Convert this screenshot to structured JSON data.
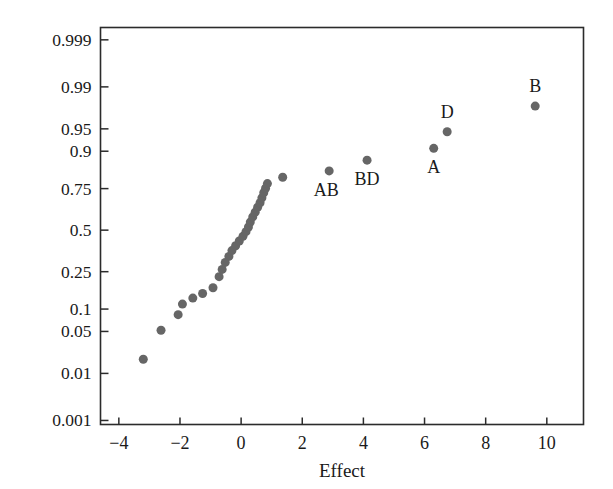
{
  "chart_data": {
    "type": "scatter",
    "title": "",
    "subtitle": "",
    "xlabel": "Effect",
    "ylabel": "",
    "xlim": [
      -4.6,
      11.2
    ],
    "ylim_probability": [
      0.0008,
      0.9995
    ],
    "grid": false,
    "legend": null,
    "xticks": [
      -4,
      -2,
      0,
      2,
      4,
      6,
      8,
      10
    ],
    "xtick_labels": [
      "−4",
      "−2",
      "0",
      "2",
      "4",
      "6",
      "8",
      "10"
    ],
    "yticks": [
      0.999,
      0.99,
      0.95,
      0.9,
      0.75,
      0.5,
      0.25,
      0.1,
      0.05,
      0.01,
      0.001
    ],
    "ytick_labels": [
      "0.999",
      "0.99",
      "0.95",
      "0.9",
      "0.75",
      "0.5",
      "0.25",
      "0.1",
      "0.05",
      "0.01",
      "0.001"
    ],
    "y_scale": "normal-probability",
    "marker": {
      "shape": "circle",
      "color": "#666666",
      "size_px": 9
    },
    "points": [
      {
        "x": -3.2,
        "p": 0.018,
        "label": ""
      },
      {
        "x": -2.62,
        "p": 0.052,
        "label": ""
      },
      {
        "x": -2.06,
        "p": 0.085,
        "label": ""
      },
      {
        "x": -1.92,
        "p": 0.115,
        "label": ""
      },
      {
        "x": -1.58,
        "p": 0.135,
        "label": ""
      },
      {
        "x": -1.26,
        "p": 0.152,
        "label": ""
      },
      {
        "x": -0.92,
        "p": 0.175,
        "label": ""
      },
      {
        "x": -0.72,
        "p": 0.225,
        "label": ""
      },
      {
        "x": -0.62,
        "p": 0.262,
        "label": ""
      },
      {
        "x": -0.52,
        "p": 0.3,
        "label": ""
      },
      {
        "x": -0.4,
        "p": 0.335,
        "label": ""
      },
      {
        "x": -0.3,
        "p": 0.37,
        "label": ""
      },
      {
        "x": -0.18,
        "p": 0.4,
        "label": ""
      },
      {
        "x": -0.06,
        "p": 0.43,
        "label": ""
      },
      {
        "x": 0.06,
        "p": 0.46,
        "label": ""
      },
      {
        "x": 0.16,
        "p": 0.49,
        "label": ""
      },
      {
        "x": 0.24,
        "p": 0.52,
        "label": ""
      },
      {
        "x": 0.3,
        "p": 0.552,
        "label": ""
      },
      {
        "x": 0.38,
        "p": 0.585,
        "label": ""
      },
      {
        "x": 0.46,
        "p": 0.615,
        "label": ""
      },
      {
        "x": 0.54,
        "p": 0.645,
        "label": ""
      },
      {
        "x": 0.62,
        "p": 0.672,
        "label": ""
      },
      {
        "x": 0.68,
        "p": 0.7,
        "label": ""
      },
      {
        "x": 0.74,
        "p": 0.728,
        "label": ""
      },
      {
        "x": 0.8,
        "p": 0.752,
        "label": ""
      },
      {
        "x": 0.86,
        "p": 0.775,
        "label": ""
      },
      {
        "x": 1.36,
        "p": 0.805,
        "label": ""
      },
      {
        "x": 2.88,
        "p": 0.832,
        "label": "AB"
      },
      {
        "x": 4.12,
        "p": 0.872,
        "label": "BD"
      },
      {
        "x": 6.3,
        "p": 0.908,
        "label": "A"
      },
      {
        "x": 6.74,
        "p": 0.945,
        "label": "D"
      },
      {
        "x": 9.62,
        "p": 0.978,
        "label": "B"
      }
    ],
    "annotations": [
      {
        "text": "AB",
        "x": 2.88,
        "p": 0.832,
        "position": "below-left"
      },
      {
        "text": "BD",
        "x": 4.12,
        "p": 0.872,
        "position": "below"
      },
      {
        "text": "A",
        "x": 6.3,
        "p": 0.908,
        "position": "below"
      },
      {
        "text": "D",
        "x": 6.74,
        "p": 0.945,
        "position": "above"
      },
      {
        "text": "B",
        "x": 9.62,
        "p": 0.978,
        "position": "above"
      }
    ]
  },
  "figure": {
    "axis_label_x": "Effect",
    "frame_color": "#2b2b2b",
    "background": "#ffffff"
  }
}
